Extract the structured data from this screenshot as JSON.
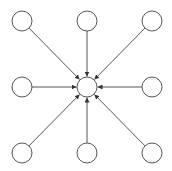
{
  "diagram": {
    "type": "star-graph",
    "center": {
      "id": "center",
      "row": 1,
      "col": 1
    },
    "nodes": [
      {
        "id": "top-left",
        "row": 0,
        "col": 0
      },
      {
        "id": "top-center",
        "row": 0,
        "col": 1
      },
      {
        "id": "top-right",
        "row": 0,
        "col": 2
      },
      {
        "id": "middle-left",
        "row": 1,
        "col": 0
      },
      {
        "id": "middle-right",
        "row": 1,
        "col": 2
      },
      {
        "id": "bottom-left",
        "row": 2,
        "col": 0
      },
      {
        "id": "bottom-center",
        "row": 2,
        "col": 1
      },
      {
        "id": "bottom-right",
        "row": 2,
        "col": 2
      }
    ],
    "edges": [
      {
        "from": "top-left",
        "to": "center"
      },
      {
        "from": "top-center",
        "to": "center"
      },
      {
        "from": "top-right",
        "to": "center"
      },
      {
        "from": "middle-left",
        "to": "center"
      },
      {
        "from": "middle-right",
        "to": "center"
      },
      {
        "from": "bottom-left",
        "to": "center"
      },
      {
        "from": "bottom-center",
        "to": "center"
      },
      {
        "from": "bottom-right",
        "to": "center"
      }
    ],
    "colors": {
      "stroke": "#555555",
      "node_fill": "#ffffff",
      "background": "#ffffff"
    }
  }
}
